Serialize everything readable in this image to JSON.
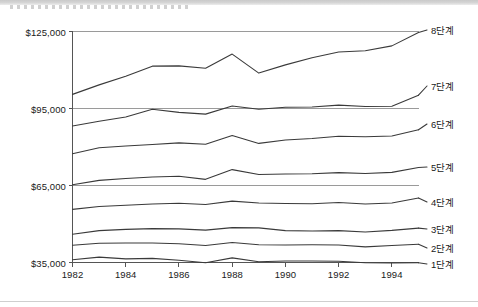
{
  "chart_data": {
    "type": "line",
    "title": "",
    "subtitle": "",
    "xlabel": "",
    "ylabel": "",
    "grid": true,
    "legend_position": "right-of-plot",
    "x": [
      1982,
      1983,
      1984,
      1985,
      1986,
      1987,
      1988,
      1989,
      1990,
      1991,
      1992,
      1993,
      1994,
      1995
    ],
    "x_tick_labels": [
      "1982",
      "1984",
      "1986",
      "1988",
      "1990",
      "1992",
      "1994"
    ],
    "x_ticks": [
      1982,
      1984,
      1986,
      1988,
      1990,
      1992,
      1994
    ],
    "xlim": [
      1982,
      1995
    ],
    "y_tick_labels": [
      "$125,000",
      "$95,000",
      "$65,000",
      "$35,000"
    ],
    "y_ticks": [
      125000,
      95000,
      65000,
      35000
    ],
    "ylim": [
      33000,
      127500
    ],
    "currency_prefix": "$",
    "line_color": "#3a3a3a",
    "grid_color": "#9a9a9a",
    "axis_color": "#555555",
    "background": "#ffffff",
    "series": [
      {
        "name": "8단계",
        "label": "8단계",
        "values": [
          100500,
          104200,
          107600,
          111500,
          111600,
          110700,
          116200,
          108800,
          112000,
          114800,
          117000,
          117500,
          119400,
          124600
        ]
      },
      {
        "name": "7단계",
        "label": "7단계",
        "values": [
          88200,
          90000,
          91700,
          94700,
          93500,
          92800,
          96000,
          94700,
          95500,
          95600,
          96300,
          95800,
          95900,
          100200
        ]
      },
      {
        "name": "6단계",
        "label": "6단계",
        "values": [
          77400,
          79700,
          80400,
          81000,
          81600,
          81100,
          84500,
          81400,
          82700,
          83300,
          84200,
          84000,
          84300,
          86700
        ]
      },
      {
        "name": "5단계",
        "label": "5단계",
        "values": [
          65300,
          67000,
          67700,
          68300,
          68600,
          67400,
          71200,
          69300,
          69500,
          69600,
          70000,
          69700,
          70100,
          72000
        ]
      },
      {
        "name": "4단계",
        "label": "4단계",
        "values": [
          55700,
          56800,
          57300,
          57800,
          58100,
          57600,
          58900,
          58200,
          58000,
          57900,
          58400,
          57800,
          58200,
          60100
        ]
      },
      {
        "name": "3단계",
        "label": "3단계",
        "values": [
          46000,
          47400,
          47900,
          48200,
          48100,
          47600,
          48600,
          48500,
          47400,
          47300,
          47400,
          46900,
          47500,
          48400
        ]
      },
      {
        "name": "2단계",
        "label": "2단계",
        "values": [
          41700,
          42500,
          42600,
          42600,
          42300,
          41600,
          42800,
          41900,
          41800,
          41900,
          41800,
          41100,
          41600,
          42100
        ]
      },
      {
        "name": "1단계",
        "label": "1단계",
        "values": [
          36100,
          37100,
          36400,
          36600,
          35900,
          34900,
          36800,
          35300,
          35600,
          35600,
          35500,
          34900,
          34800,
          34900
        ]
      }
    ]
  },
  "legend": {
    "entries": [
      {
        "label": "8단계"
      },
      {
        "label": "7단계"
      },
      {
        "label": "6단계"
      },
      {
        "label": "5단계"
      },
      {
        "label": "4단계"
      },
      {
        "label": "3단계"
      },
      {
        "label": "2단계"
      },
      {
        "label": "1단계"
      }
    ]
  },
  "legend_label_positions": {
    "s8": 30,
    "s7": 86,
    "s6": 124,
    "s5": 167,
    "s4": 202,
    "s3": 229,
    "s2": 248,
    "s1": 264
  }
}
